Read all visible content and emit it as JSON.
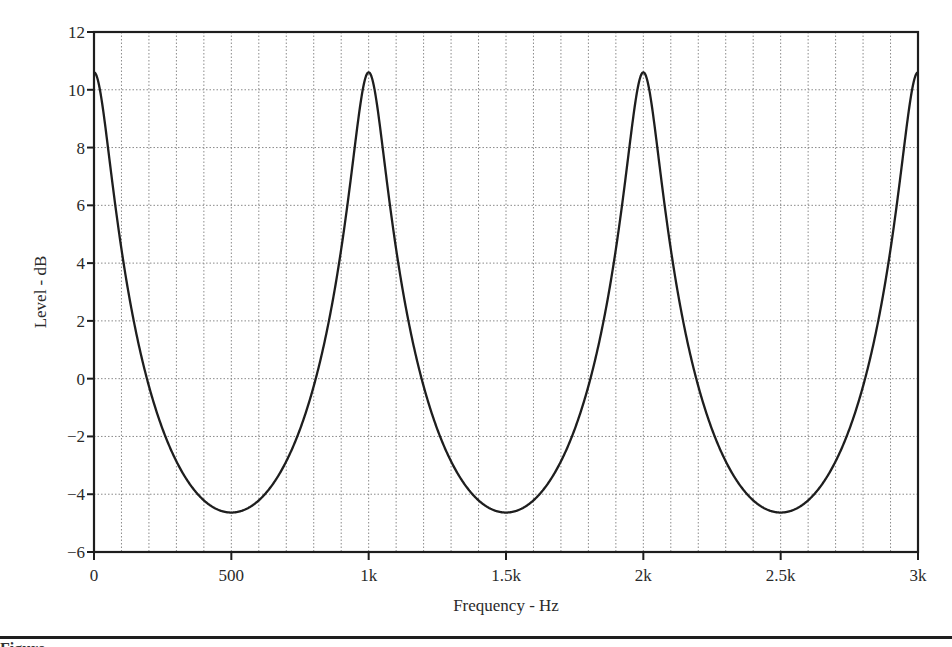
{
  "chart_data": {
    "type": "line",
    "title": "",
    "xlabel": "Frequency - Hz",
    "ylabel": "Level - dB",
    "xlim": [
      0,
      3000
    ],
    "ylim": [
      -6,
      12
    ],
    "x_ticks": [
      0,
      500,
      1000,
      1500,
      2000,
      2500,
      3000
    ],
    "x_tick_labels": [
      "0",
      "500",
      "1k",
      "1.5k",
      "2k",
      "2.5k",
      "3k"
    ],
    "y_ticks": [
      -6,
      -4,
      -2,
      0,
      2,
      4,
      6,
      8,
      10,
      12
    ],
    "y_tick_labels": [
      "−6",
      "−4",
      "−2",
      "0",
      "2",
      "4",
      "6",
      "8",
      "10",
      "12"
    ],
    "x_minor_grid_step": 100,
    "y_grid_step": 2,
    "grid": true,
    "grid_style": "dotted",
    "legend": null,
    "model": {
      "description": "Feedback comb filter response, 1 ms delay",
      "delay_ms": 1.0,
      "gain": 0.705
    },
    "series": [
      {
        "name": "Level",
        "color": "#1e1e1e",
        "x": [
          0,
          50,
          100,
          150,
          200,
          250,
          300,
          350,
          400,
          450,
          500,
          550,
          600,
          650,
          700,
          750,
          800,
          850,
          900,
          950,
          1000,
          1500,
          2000,
          2500,
          3000
        ],
        "y": [
          10.6,
          8.1,
          4.5,
          1.8,
          -0.3,
          -1.8,
          -2.9,
          -3.7,
          -4.2,
          -4.5,
          -4.6,
          -4.5,
          -4.2,
          -3.7,
          -2.9,
          -1.8,
          -0.3,
          1.8,
          4.5,
          8.1,
          10.6,
          -4.6,
          10.6,
          -4.6,
          10.6
        ]
      }
    ],
    "peaks": [
      {
        "x": 0,
        "y": 10.6
      },
      {
        "x": 1000,
        "y": 10.6
      },
      {
        "x": 2000,
        "y": 10.6
      },
      {
        "x": 3000,
        "y": 10.6
      }
    ],
    "troughs": [
      {
        "x": 500,
        "y": -4.6
      },
      {
        "x": 1500,
        "y": -4.7
      },
      {
        "x": 2500,
        "y": -4.7
      }
    ]
  },
  "caption": {
    "text": "Figure"
  }
}
